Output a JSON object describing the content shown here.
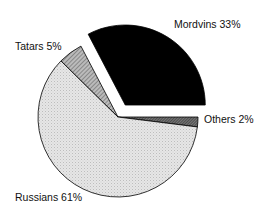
{
  "chart_data": {
    "type": "pie",
    "title": "",
    "slices": [
      {
        "label": "Others",
        "value": 2,
        "pattern": "dark-hatch",
        "exploded": false
      },
      {
        "label": "Russians",
        "value": 61,
        "pattern": "light-dots",
        "exploded": true
      },
      {
        "label": "Tatars",
        "value": 5,
        "pattern": "medium-hatch",
        "exploded": false
      },
      {
        "label": "Mordvins",
        "value": 33,
        "pattern": "solid-black",
        "exploded": true
      }
    ],
    "labels": {
      "mordvins": "Mordvins 33%",
      "tatars": "Tatars 5%",
      "others": "Others 2%",
      "russians": "Russians 61%"
    },
    "legend": "none (direct labels)"
  }
}
